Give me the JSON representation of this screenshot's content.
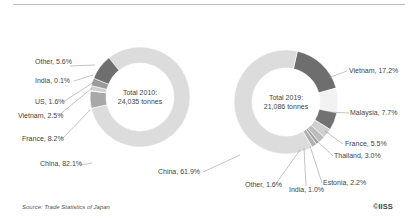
{
  "chart_data": [
    {
      "type": "pie",
      "variant": "donut",
      "title": "Total 2010: 24,035 tonnes",
      "center_label": [
        "Total 2010:",
        "24,035 tonnes"
      ],
      "categories": [
        "China",
        "Other",
        "India",
        "US",
        "Vietnam",
        "France"
      ],
      "values": [
        82.1,
        5.6,
        0.1,
        1.6,
        2.5,
        8.2
      ],
      "labels": [
        "China, 82.1%",
        "Other, 5.6%",
        "India, 0.1%",
        "US, 1.6%",
        "Vietnam, 2.5%",
        "France, 8.2%"
      ],
      "colors": [
        "#dcdcdc",
        "#a8a8a8",
        "#bdbdbd",
        "#d0d0d0",
        "#9a9a9a",
        "#6e6e6e"
      ]
    },
    {
      "type": "pie",
      "variant": "donut",
      "title": "Total 2019: 21,086 tonnes",
      "center_label": [
        "Total 2019:",
        "21,086 tonnes"
      ],
      "categories": [
        "Vietnam",
        "Malaysia",
        "France",
        "Thailand",
        "Estonia",
        "India",
        "Other",
        "China"
      ],
      "values": [
        17.2,
        7.7,
        5.5,
        3.0,
        2.2,
        1.0,
        1.6,
        61.9
      ],
      "labels": [
        "Vietnam, 17.2%",
        "Malaysia, 7.7%",
        "France, 5.5%",
        "Thailand, 3.0%",
        "Estonia, 2.2%",
        "India, 1.0%",
        "Other, 1.6%",
        "China, 61.9%"
      ],
      "colors": [
        "#6e6e6e",
        "#f2f2f2",
        "#727272",
        "#d0d0d0",
        "#bdbdbd",
        "#a0a0a0",
        "#b0b0b0",
        "#dcdcdc"
      ]
    }
  ],
  "footer": {
    "source": "Source: Trade Statistics of Japan",
    "credit": "©IISS"
  }
}
